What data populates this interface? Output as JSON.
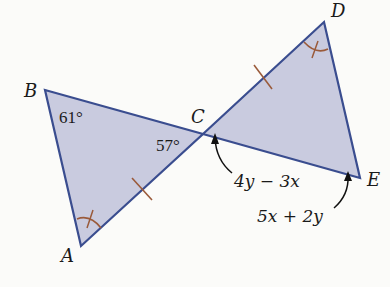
{
  "diagram": {
    "type": "two triangles sharing vertex C (vertical angles)",
    "colors": {
      "fill": "#c9cbdf",
      "edge": "#3a4d8f",
      "mark": "#9a5a3a",
      "text": "#1a1a1a",
      "background": "#fbfbf9"
    },
    "vertices": {
      "A": {
        "label": "A",
        "x": 81,
        "y": 246
      },
      "B": {
        "label": "B",
        "x": 45,
        "y": 90
      },
      "C": {
        "label": "C",
        "x": 203,
        "y": 134
      },
      "D": {
        "label": "D",
        "x": 324,
        "y": 22
      },
      "E": {
        "label": "E",
        "x": 360,
        "y": 178
      }
    },
    "angle_labels": {
      "B": "61°",
      "C": "57°"
    },
    "expressions": {
      "CE_near_C": "4y − 3x",
      "CE_near_E": "5x + 2y"
    },
    "marks": {
      "congruent_sides": [
        "AC",
        "CD"
      ],
      "congruent_angles": [
        "A",
        "D"
      ]
    }
  }
}
